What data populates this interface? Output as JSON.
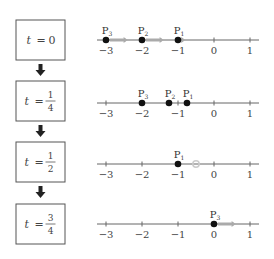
{
  "diagram": {
    "axis": {
      "min": -3,
      "max": 1,
      "ticks": [
        -3,
        -2,
        -1,
        0,
        1
      ],
      "tick_labels": [
        "−3",
        "−2",
        "−1",
        "0",
        "1"
      ]
    },
    "arrow_icon": "down-arrow",
    "colors": {
      "point": "#111111",
      "motion_arrow": "#aaaaaa",
      "ghost_point": "#cccccc"
    },
    "steps": [
      {
        "time_label": {
          "var": "t",
          "eq": "=",
          "whole": "0"
        },
        "points": [
          {
            "name": "P",
            "sub": "3",
            "x": -3,
            "arrow_to": -2.4
          },
          {
            "name": "P",
            "sub": "2",
            "x": -2,
            "arrow_to": -1.4
          },
          {
            "name": "P",
            "sub": "1",
            "x": -1,
            "arrow_to": -0.8
          }
        ],
        "ghosts": []
      },
      {
        "time_label": {
          "var": "t",
          "eq": "=",
          "num": "1",
          "den": "4"
        },
        "points": [
          {
            "name": "P",
            "sub": "3",
            "x": -2
          },
          {
            "name": "P",
            "sub": "2",
            "x": -1.25
          },
          {
            "name": "P",
            "sub": "1",
            "x": -0.75
          }
        ],
        "ghosts": []
      },
      {
        "time_label": {
          "var": "t",
          "eq": "=",
          "num": "1",
          "den": "2"
        },
        "points": [
          {
            "name": "P",
            "sub": "1",
            "x": -1
          }
        ],
        "ghosts": [
          {
            "x": -0.5
          }
        ]
      },
      {
        "time_label": {
          "var": "t",
          "eq": "=",
          "num": "3",
          "den": "4"
        },
        "points": [
          {
            "name": "P",
            "sub": "3",
            "x": 0,
            "arrow_to": 0.6
          }
        ],
        "ghosts": []
      }
    ]
  }
}
